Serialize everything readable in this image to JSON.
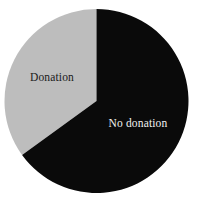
{
  "chart_data": {
    "type": "pie",
    "title": "",
    "subtitle": "",
    "xlabel": "",
    "ylabel": "",
    "legend_position": "none",
    "grid": false,
    "labels_inside": true,
    "start_angle_deg": 0,
    "direction": "counterclockwise",
    "categories": [
      "Donation",
      "No donation"
    ],
    "values": [
      35,
      65
    ],
    "value_unit": "percent",
    "slices": [
      {
        "label": "Donation",
        "value": 35,
        "angle_deg": 126,
        "color": "#bdbdbd",
        "label_color": "#1a1a1a",
        "label_x": 52,
        "label_y": 78
      },
      {
        "label": "No donation",
        "value": 65,
        "angle_deg": 234,
        "color": "#0a0a0a",
        "label_color": "#f2f2f2",
        "label_x": 138,
        "label_y": 124
      }
    ]
  },
  "figure": {
    "width": 199,
    "height": 207,
    "background": "#ffffff",
    "center_x": 96.5,
    "center_y": 101,
    "radius": 92
  }
}
